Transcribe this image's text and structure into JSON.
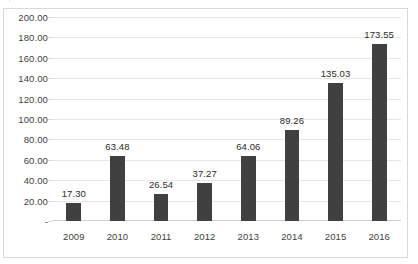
{
  "clipped_caption": "· ı · ··",
  "chart_data": {
    "type": "bar",
    "title": "",
    "subtitle": "",
    "xlabel": "",
    "ylabel": "",
    "categories": [
      "2009",
      "2010",
      "2011",
      "2012",
      "2013",
      "2014",
      "2015",
      "2016"
    ],
    "values": [
      17.3,
      63.48,
      26.54,
      37.27,
      64.06,
      89.26,
      135.03,
      173.55
    ],
    "value_labels": [
      "17.30",
      "63.48",
      "26.54",
      "37.27",
      "64.06",
      "89.26",
      "135.03",
      "173.55"
    ],
    "ylim": [
      0,
      200
    ],
    "ytick_values": [
      200,
      180,
      160,
      140,
      120,
      100,
      80,
      60,
      40,
      20,
      0
    ],
    "ytick_labels": [
      "200.00",
      "180.00",
      "160.00",
      "140.00",
      "120.00",
      "100.00",
      "80.00",
      "60.00",
      "40.00",
      "20.00",
      "-"
    ],
    "grid": "horizontal",
    "legend": "none",
    "bar_color": "#404040",
    "gridline_color": "#e6e6e6",
    "border_color": "#d9d9d9",
    "background_color": "#ffffff",
    "text_color": "#3f3f3f"
  }
}
